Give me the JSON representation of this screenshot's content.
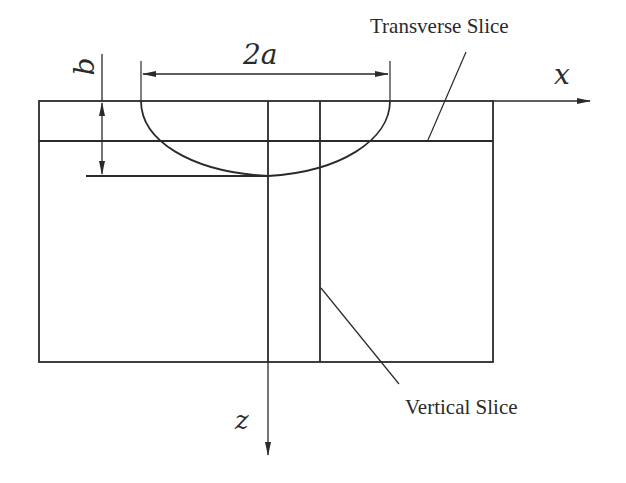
{
  "diagram": {
    "type": "cross-section schematic",
    "labels": {
      "width_dimension": "2a",
      "depth_dimension": "b",
      "x_axis": "x",
      "z_axis": "z",
      "transverse_slice": "Transverse Slice",
      "vertical_slice": "Vertical Slice"
    },
    "colors": {
      "line": "#2a2a2a",
      "background": "#ffffff"
    }
  }
}
